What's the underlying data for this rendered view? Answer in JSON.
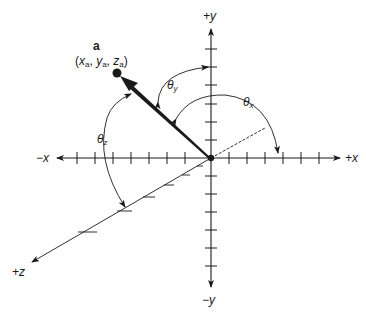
{
  "figure": {
    "axes": {
      "pos_x_label": "+x",
      "neg_x_label": "−x",
      "pos_y_label": "+y",
      "neg_y_label": "−y",
      "pos_z_label": "+z"
    },
    "vector": {
      "name": "a",
      "coord_open": "(",
      "x_var": "x",
      "y_var": "y",
      "z_var": "z",
      "sub": "a",
      "sep": ", ",
      "coord_close": ")"
    },
    "angles": {
      "theta_x_symbol": "θ",
      "theta_x_sub": "x",
      "theta_y_symbol": "θ",
      "theta_y_sub": "y",
      "theta_z_symbol": "θ",
      "theta_z_sub": "z"
    },
    "colors": {
      "ink": "#1a1a1a",
      "background": "#ffffff"
    }
  }
}
